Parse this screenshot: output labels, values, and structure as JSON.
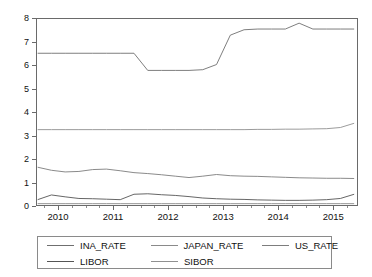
{
  "chart_data": {
    "type": "line",
    "title": "",
    "xlabel": "",
    "ylabel": "",
    "xlim": [
      2009.6,
      2015.45
    ],
    "ylim": [
      0,
      8
    ],
    "grid": false,
    "legend_position": "bottom",
    "x_ticks_major": [
      2010,
      2011,
      2012,
      2013,
      2014,
      2015
    ],
    "x_tick_labels": [
      "2010",
      "2011",
      "2012",
      "2013",
      "2014",
      "2015"
    ],
    "x_minor_per_interval": 3,
    "y_ticks": [
      0,
      1,
      2,
      3,
      4,
      5,
      6,
      7,
      8
    ],
    "y_tick_labels": [
      "0",
      "1",
      "2",
      "3",
      "4",
      "5",
      "6",
      "7",
      "8"
    ],
    "x": [
      2009.63,
      2009.88,
      2010.13,
      2010.38,
      2010.63,
      2010.88,
      2011.13,
      2011.38,
      2011.63,
      2011.88,
      2012.13,
      2012.38,
      2012.63,
      2012.88,
      2013.13,
      2013.38,
      2013.63,
      2013.88,
      2014.13,
      2014.38,
      2014.63,
      2014.88,
      2015.13,
      2015.38
    ],
    "series": [
      {
        "name": "INA_RATE",
        "color": "#6f6f6f",
        "values": [
          6.5,
          6.5,
          6.5,
          6.5,
          6.5,
          6.5,
          6.5,
          6.5,
          5.77,
          5.77,
          5.77,
          5.77,
          5.8,
          6.02,
          7.27,
          7.5,
          7.53,
          7.53,
          7.53,
          7.78,
          7.53,
          7.53,
          7.53,
          7.53
        ]
      },
      {
        "name": "JAPAN_RATE",
        "color": "#8a8a8a",
        "values": [
          0.1,
          0.1,
          0.1,
          0.1,
          0.1,
          0.1,
          0.1,
          0.1,
          0.1,
          0.1,
          0.1,
          0.1,
          0.1,
          0.1,
          0.1,
          0.1,
          0.1,
          0.1,
          0.1,
          0.1,
          0.1,
          0.1,
          0.1,
          0.1
        ]
      },
      {
        "name": "US_RATE",
        "color": "#7d7d7d",
        "values": [
          1.65,
          1.52,
          1.45,
          1.47,
          1.55,
          1.57,
          1.5,
          1.42,
          1.38,
          1.33,
          1.27,
          1.21,
          1.27,
          1.34,
          1.29,
          1.27,
          1.26,
          1.24,
          1.22,
          1.2,
          1.19,
          1.18,
          1.18,
          1.17
        ]
      },
      {
        "name": "LIBOR",
        "color": "#555555",
        "values": [
          0.27,
          0.47,
          0.39,
          0.32,
          0.31,
          0.29,
          0.27,
          0.5,
          0.52,
          0.48,
          0.45,
          0.4,
          0.34,
          0.31,
          0.29,
          0.28,
          0.26,
          0.25,
          0.24,
          0.24,
          0.25,
          0.27,
          0.32,
          0.5
        ]
      },
      {
        "name": "SIBOR",
        "color": "#909090",
        "values": [
          3.25,
          3.25,
          3.25,
          3.25,
          3.25,
          3.25,
          3.25,
          3.25,
          3.25,
          3.25,
          3.25,
          3.25,
          3.25,
          3.25,
          3.25,
          3.25,
          3.26,
          3.26,
          3.27,
          3.27,
          3.28,
          3.29,
          3.34,
          3.52
        ]
      }
    ],
    "legend_rows": [
      [
        "INA_RATE",
        "JAPAN_RATE",
        "US_RATE"
      ],
      [
        "LIBOR",
        "SIBOR"
      ]
    ]
  }
}
